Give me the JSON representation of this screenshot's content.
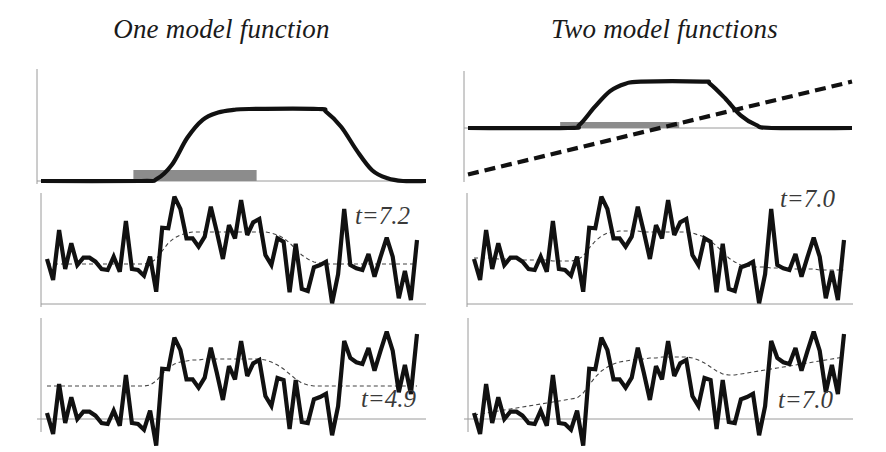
{
  "columns": [
    {
      "title": "One model function"
    },
    {
      "title": "Two model functions"
    }
  ],
  "colors": {
    "line": "#111111",
    "axis": "#9a9a9a",
    "shade": "#8c8c8c",
    "model": "#444444"
  },
  "chart_data": [
    {
      "type": "line",
      "title": "One model function — model (top-left)",
      "xlabel": "",
      "ylabel": "",
      "grid": false,
      "series": [
        {
          "name": "model bump",
          "style": "solid-thick",
          "points": [
            [
              0,
              0
            ],
            [
              26,
              0
            ],
            [
              30,
              2
            ],
            [
              34,
              18
            ],
            [
              38,
              48
            ],
            [
              42,
              68
            ],
            [
              46,
              76
            ],
            [
              50,
              79
            ],
            [
              54,
              80
            ],
            [
              72,
              80
            ],
            [
              74,
              77
            ],
            [
              78,
              60
            ],
            [
              82,
              34
            ],
            [
              86,
              12
            ],
            [
              90,
              3
            ],
            [
              94,
              0
            ],
            [
              100,
              0
            ]
          ]
        }
      ],
      "shaded_interval": {
        "x": [
          24,
          56
        ],
        "height": 11
      },
      "xlim": [
        0,
        100
      ],
      "ylim": [
        0,
        100
      ]
    },
    {
      "type": "line",
      "title": "Two model functions — models (top-right)",
      "xlabel": "",
      "ylabel": "",
      "grid": false,
      "series": [
        {
          "name": "model bump",
          "style": "solid-thick",
          "points": [
            [
              0,
              0
            ],
            [
              26,
              0
            ],
            [
              29,
              3
            ],
            [
              33,
              20
            ],
            [
              37,
              35
            ],
            [
              41,
              42
            ],
            [
              45,
              44
            ],
            [
              61,
              44
            ],
            [
              63,
              42
            ],
            [
              67,
              28
            ],
            [
              71,
              12
            ],
            [
              75,
              3
            ],
            [
              79,
              0
            ],
            [
              100,
              0
            ]
          ]
        },
        {
          "name": "linear trend",
          "style": "dashed-thick",
          "points": [
            [
              0,
              -44
            ],
            [
              100,
              44
            ]
          ]
        }
      ],
      "shaded_interval": {
        "x": [
          24,
          55
        ],
        "height": 6
      },
      "xlim": [
        0,
        100
      ],
      "ylim": [
        -50,
        55
      ]
    },
    {
      "type": "line",
      "title": "Noisy data with one-function fit (middle-left)",
      "annotation": "t=7.2",
      "series": [
        {
          "name": "data",
          "style": "solid-thick",
          "values": [
            45,
            24,
            74,
            35,
            60.7,
            39,
            46.3,
            46.3,
            42.3,
            35,
            34,
            47.3,
            32.3,
            83,
            35,
            34,
            28.3,
            47.3,
            12.3,
            76.3,
            75.7,
            107.3,
            95,
            65.7,
            65.7,
            57.3,
            67.3,
            97.3,
            72.3,
            45,
            79,
            65.7,
            104,
            69,
            81.7,
            85,
            49,
            39,
            65.7,
            62.3,
            11.7,
            60.3,
            15,
            13,
            36.7,
            39,
            42.3,
            0.7,
            29.7,
            95,
            39,
            35.7,
            34,
            50,
            27.3,
            47.3,
            66.3,
            47.3,
            5.7,
            33,
            4,
            64
          ]
        },
        {
          "name": "fit",
          "style": "dashed-thin",
          "values": [
            40,
            40,
            40,
            40,
            40,
            40,
            40,
            40,
            40,
            40,
            40,
            40,
            40,
            40,
            40,
            40,
            40,
            41,
            45,
            53,
            61,
            66,
            69,
            71,
            72,
            72,
            72,
            72,
            72,
            72,
            72,
            72,
            72,
            72,
            72,
            72,
            72,
            71,
            69,
            66,
            61,
            55,
            49,
            45,
            42,
            41,
            40,
            40,
            40,
            40,
            40,
            40,
            40,
            40,
            40,
            40,
            40,
            40,
            40,
            40,
            40,
            40
          ]
        }
      ],
      "ylim": [
        0,
        115
      ]
    },
    {
      "type": "line",
      "title": "Noisy data with two-function fit (middle-right)",
      "annotation": "t=7.0",
      "series": [
        {
          "name": "data",
          "style": "solid-thick",
          "values": [
            45,
            24,
            74,
            35,
            60.7,
            39,
            46.3,
            46.3,
            42.3,
            35,
            34,
            47.3,
            32.3,
            83,
            35,
            34,
            28.3,
            47.3,
            12.3,
            76.3,
            75.7,
            107.3,
            95,
            65.7,
            65.7,
            57.3,
            67.3,
            97.3,
            72.3,
            45,
            79,
            65.7,
            104,
            69,
            81.7,
            85,
            49,
            39,
            65.7,
            62.3,
            11.7,
            60.3,
            15,
            13,
            36.7,
            39,
            42.3,
            0.7,
            29.7,
            95,
            39,
            35.7,
            34,
            50,
            27.3,
            47.3,
            66.3,
            47.3,
            5.7,
            33,
            4,
            64
          ]
        },
        {
          "name": "fit",
          "style": "dashed-thin",
          "values": [
            46,
            46,
            46,
            46,
            45,
            45,
            45,
            45,
            44,
            44,
            44,
            44,
            44,
            43,
            43,
            43,
            43,
            44,
            48,
            56,
            63,
            68,
            71,
            72,
            73,
            73,
            73,
            73,
            72,
            72,
            72,
            72,
            72,
            72,
            72,
            72,
            71,
            69,
            67,
            63,
            58,
            52,
            46,
            42,
            39,
            38,
            37,
            37,
            37,
            36,
            36,
            36,
            36,
            35,
            35,
            35,
            35,
            34,
            34,
            34,
            34,
            34
          ]
        }
      ],
      "ylim": [
        0,
        115
      ]
    },
    {
      "type": "line",
      "title": "Shifted data with one-function fit (bottom-left)",
      "annotation": "t=4.9",
      "series": [
        {
          "name": "data",
          "style": "solid-thick",
          "values": [
            6,
            -15,
            35,
            -4,
            21.7,
            0,
            7.3,
            7.3,
            3.3,
            -4,
            -5,
            8.3,
            -6.7,
            44,
            -4,
            -5,
            -10.7,
            8.3,
            -26.7,
            50.3,
            49.7,
            81.3,
            69,
            39.7,
            39.7,
            31.3,
            41.3,
            71.3,
            46.3,
            19,
            53,
            39.7,
            78,
            43,
            55.7,
            59,
            23,
            13,
            41,
            39,
            -10,
            39,
            -3,
            -4,
            19.7,
            22,
            25.3,
            -16.3,
            12.7,
            78,
            61,
            56.7,
            55,
            71,
            48.3,
            68.3,
            87.3,
            68.3,
            26.7,
            54,
            25,
            85
          ]
        },
        {
          "name": "fit",
          "style": "dashed-thin",
          "values": [
            33,
            33,
            33,
            33,
            33,
            33,
            33,
            33,
            33,
            33,
            33,
            33,
            33,
            33,
            33,
            33,
            33,
            34,
            38,
            45,
            51,
            55,
            57,
            58,
            59,
            59,
            60,
            60,
            60,
            60,
            60,
            60,
            60,
            60,
            60,
            60,
            59,
            57,
            54,
            50,
            45,
            40,
            36,
            34,
            33,
            33,
            33,
            33,
            33,
            33,
            33,
            33,
            33,
            33,
            33,
            33,
            33,
            33,
            33,
            33,
            33,
            33
          ]
        }
      ],
      "ylim": [
        -30,
        95
      ]
    },
    {
      "type": "line",
      "title": "Shifted data with two-function fit (bottom-right)",
      "annotation": "t=7.0",
      "series": [
        {
          "name": "data",
          "style": "solid-thick",
          "values": [
            6,
            -15,
            35,
            -4,
            21.7,
            0,
            7.3,
            7.3,
            3.3,
            -4,
            -5,
            8.3,
            -6.7,
            44,
            -4,
            -5,
            -10.7,
            8.3,
            -26.7,
            50.3,
            49.7,
            81.3,
            69,
            39.7,
            39.7,
            31.3,
            41.3,
            71.3,
            46.3,
            19,
            53,
            39.7,
            78,
            43,
            55.7,
            59,
            23,
            13,
            41,
            39,
            -10,
            39,
            -3,
            -4,
            19.7,
            22,
            25.3,
            -16.3,
            12.7,
            78,
            61,
            56.7,
            55,
            71,
            48.3,
            68.3,
            87.3,
            68.3,
            26.7,
            54,
            25,
            85
          ]
        },
        {
          "name": "fit",
          "style": "dashed-thin",
          "values": [
            4,
            5,
            6,
            7,
            8,
            9,
            10,
            11,
            12,
            13,
            14,
            15,
            16,
            17,
            18,
            19,
            20,
            21,
            26,
            34,
            42,
            48,
            52,
            55,
            57,
            58,
            59,
            60,
            60,
            61,
            61,
            62,
            62,
            62,
            62,
            62,
            61,
            59,
            56,
            52,
            48,
            45,
            44,
            44,
            45,
            46,
            47,
            48,
            49,
            50,
            51,
            52,
            53,
            54,
            55,
            56,
            57,
            58,
            59,
            60,
            61,
            62
          ]
        }
      ],
      "ylim": [
        -30,
        95
      ]
    }
  ]
}
